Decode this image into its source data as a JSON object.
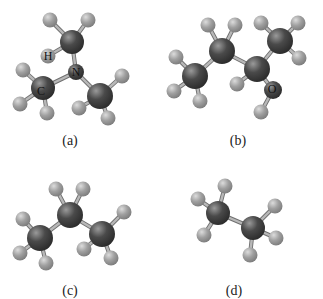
{
  "figure": {
    "panels": [
      {
        "id": "a",
        "caption": "(a)",
        "molecule": "trimethylamine-like (N with three CH3 groups)",
        "labels": [
          {
            "text": "H",
            "x": 48,
            "y": 56
          },
          {
            "text": "N",
            "x": 76,
            "y": 72
          },
          {
            "text": "C",
            "x": 41,
            "y": 91
          }
        ],
        "heavy_atoms": [
          {
            "el": "C",
            "x": 72,
            "y": 42,
            "r": 12
          },
          {
            "el": "N",
            "x": 76,
            "y": 72,
            "r": 8
          },
          {
            "el": "C",
            "x": 43,
            "y": 88,
            "r": 12
          },
          {
            "el": "C",
            "x": 100,
            "y": 96,
            "r": 13
          }
        ],
        "hydrogens": [
          {
            "x": 50,
            "y": 20
          },
          {
            "x": 88,
            "y": 20
          },
          {
            "x": 48,
            "y": 56
          },
          {
            "x": 23,
            "y": 70
          },
          {
            "x": 20,
            "y": 104
          },
          {
            "x": 47,
            "y": 113
          },
          {
            "x": 122,
            "y": 76
          },
          {
            "x": 79,
            "y": 108
          },
          {
            "x": 108,
            "y": 118
          }
        ],
        "bonds": [
          [
            72,
            42,
            76,
            72
          ],
          [
            76,
            72,
            43,
            88
          ],
          [
            76,
            72,
            100,
            96
          ],
          [
            72,
            42,
            50,
            20
          ],
          [
            72,
            42,
            88,
            20
          ],
          [
            72,
            42,
            48,
            56
          ],
          [
            43,
            88,
            23,
            70
          ],
          [
            43,
            88,
            20,
            104
          ],
          [
            43,
            88,
            47,
            113
          ],
          [
            100,
            96,
            122,
            76
          ],
          [
            100,
            96,
            79,
            108
          ],
          [
            100,
            96,
            108,
            118
          ]
        ],
        "caption_pos": {
          "x": 50,
          "y": 133
        }
      },
      {
        "id": "b",
        "caption": "(b)",
        "molecule": "2-butanol",
        "labels": [
          {
            "text": "O",
            "x": 272,
            "y": 89
          }
        ],
        "heavy_atoms": [
          {
            "el": "C",
            "x": 195,
            "y": 76,
            "r": 13
          },
          {
            "el": "C",
            "x": 222,
            "y": 51,
            "r": 13
          },
          {
            "el": "C",
            "x": 257,
            "y": 69,
            "r": 13
          },
          {
            "el": "C",
            "x": 280,
            "y": 41,
            "r": 13
          },
          {
            "el": "O",
            "x": 273,
            "y": 90,
            "r": 9
          }
        ],
        "hydrogens": [
          {
            "x": 176,
            "y": 57
          },
          {
            "x": 174,
            "y": 91
          },
          {
            "x": 200,
            "y": 101
          },
          {
            "x": 208,
            "y": 25
          },
          {
            "x": 235,
            "y": 25
          },
          {
            "x": 237,
            "y": 84
          },
          {
            "x": 261,
            "y": 23
          },
          {
            "x": 298,
            "y": 23
          },
          {
            "x": 299,
            "y": 58
          },
          {
            "x": 261,
            "y": 112
          }
        ],
        "bonds": [
          [
            195,
            76,
            222,
            51
          ],
          [
            222,
            51,
            257,
            69
          ],
          [
            257,
            69,
            280,
            41
          ],
          [
            257,
            69,
            273,
            90
          ],
          [
            195,
            76,
            176,
            57
          ],
          [
            195,
            76,
            174,
            91
          ],
          [
            195,
            76,
            200,
            101
          ],
          [
            222,
            51,
            208,
            25
          ],
          [
            222,
            51,
            235,
            25
          ],
          [
            257,
            69,
            237,
            84
          ],
          [
            280,
            41,
            261,
            23
          ],
          [
            280,
            41,
            298,
            23
          ],
          [
            280,
            41,
            299,
            58
          ],
          [
            273,
            90,
            261,
            112
          ]
        ],
        "caption_pos": {
          "x": 218,
          "y": 133
        }
      },
      {
        "id": "c",
        "caption": "(c)",
        "molecule": "propane",
        "labels": [],
        "heavy_atoms": [
          {
            "el": "C",
            "x": 40,
            "y": 238,
            "r": 13
          },
          {
            "el": "C",
            "x": 70,
            "y": 215,
            "r": 13
          },
          {
            "el": "C",
            "x": 102,
            "y": 234,
            "r": 13
          }
        ],
        "hydrogens": [
          {
            "x": 23,
            "y": 219
          },
          {
            "x": 20,
            "y": 253
          },
          {
            "x": 46,
            "y": 263
          },
          {
            "x": 56,
            "y": 189
          },
          {
            "x": 83,
            "y": 189
          },
          {
            "x": 84,
            "y": 249
          },
          {
            "x": 124,
            "y": 212
          },
          {
            "x": 111,
            "y": 258
          }
        ],
        "bonds": [
          [
            40,
            238,
            70,
            215
          ],
          [
            70,
            215,
            102,
            234
          ],
          [
            40,
            238,
            23,
            219
          ],
          [
            40,
            238,
            20,
            253
          ],
          [
            40,
            238,
            46,
            263
          ],
          [
            70,
            215,
            56,
            189
          ],
          [
            70,
            215,
            83,
            189
          ],
          [
            102,
            234,
            84,
            249
          ],
          [
            102,
            234,
            124,
            212
          ],
          [
            102,
            234,
            111,
            258
          ]
        ],
        "caption_pos": {
          "x": 50,
          "y": 283
        }
      },
      {
        "id": "d",
        "caption": "(d)",
        "molecule": "ethane",
        "labels": [],
        "heavy_atoms": [
          {
            "el": "C",
            "x": 218,
            "y": 213,
            "r": 12
          },
          {
            "el": "C",
            "x": 253,
            "y": 228,
            "r": 12
          }
        ],
        "hydrogens": [
          {
            "x": 225,
            "y": 186
          },
          {
            "x": 198,
            "y": 199
          },
          {
            "x": 204,
            "y": 235
          },
          {
            "x": 275,
            "y": 206
          },
          {
            "x": 276,
            "y": 238
          },
          {
            "x": 250,
            "y": 255
          }
        ],
        "bonds": [
          [
            218,
            213,
            253,
            228
          ],
          [
            218,
            213,
            225,
            186
          ],
          [
            218,
            213,
            198,
            199
          ],
          [
            218,
            213,
            204,
            235
          ],
          [
            253,
            228,
            275,
            206
          ],
          [
            253,
            228,
            276,
            238
          ],
          [
            253,
            228,
            250,
            255
          ]
        ],
        "caption_pos": {
          "x": 214,
          "y": 283
        }
      }
    ],
    "colors": {
      "heavy_atom": "#3a3a3a",
      "heavy_highlight": "#8c8c8c",
      "hydrogen": "#9a9a9a",
      "hydrogen_highlight": "#d4d4d4",
      "bond": "#b8b8b8",
      "bond_edge": "#6f6f6f"
    }
  }
}
